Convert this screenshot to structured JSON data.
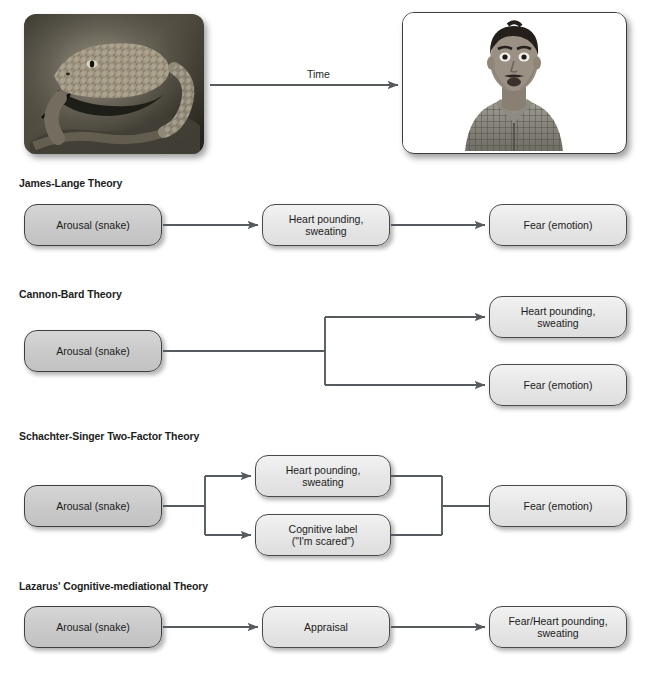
{
  "figure": {
    "top_sequence": {
      "stimulus_photo": "rattlesnake-photo",
      "reaction_photo": "startled-man-photo",
      "arrow_label": "Time"
    },
    "theories": [
      {
        "id": "james-lange",
        "title": "James-Lange Theory",
        "nodes": [
          {
            "id": "arousal",
            "label": "Arousal (snake)",
            "style": "dark"
          },
          {
            "id": "bodily",
            "label": "Heart pounding,\nsweating",
            "style": "light"
          },
          {
            "id": "emotion",
            "label": "Fear (emotion)",
            "style": "light"
          }
        ]
      },
      {
        "id": "cannon-bard",
        "title": "Cannon-Bard Theory",
        "nodes": [
          {
            "id": "arousal",
            "label": "Arousal (snake)",
            "style": "dark"
          },
          {
            "id": "bodily",
            "label": "Heart pounding,\nsweating",
            "style": "light"
          },
          {
            "id": "emotion",
            "label": "Fear (emotion)",
            "style": "light"
          }
        ]
      },
      {
        "id": "schachter-singer",
        "title": "Schachter-Singer Two-Factor Theory",
        "nodes": [
          {
            "id": "arousal",
            "label": "Arousal (snake)",
            "style": "dark"
          },
          {
            "id": "bodily",
            "label": "Heart pounding,\nsweating",
            "style": "light"
          },
          {
            "id": "cognitive",
            "label": "Cognitive label\n(\"I'm scared\")",
            "style": "light"
          },
          {
            "id": "emotion",
            "label": "Fear (emotion)",
            "style": "light"
          }
        ]
      },
      {
        "id": "lazarus",
        "title": "Lazarus' Cognitive-mediational Theory",
        "nodes": [
          {
            "id": "arousal",
            "label": "Arousal (snake)",
            "style": "dark"
          },
          {
            "id": "appraisal",
            "label": "Appraisal",
            "style": "light"
          },
          {
            "id": "outcome",
            "label": "Fear/Heart pounding,\nsweating",
            "style": "light"
          }
        ]
      }
    ],
    "colors": {
      "box_border": "#4a4a4a",
      "box_fill_light": "#e9e9e9",
      "box_fill_dark": "#cccccc",
      "connector": "#555b5e",
      "text": "#1b1b1b",
      "background": "#ffffff"
    }
  }
}
